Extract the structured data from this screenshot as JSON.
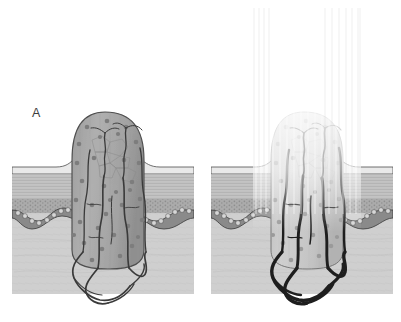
{
  "figure": {
    "type": "medical-illustration",
    "background_color": "#ffffff",
    "width": 401,
    "height": 322
  },
  "panels": [
    {
      "id": "a",
      "label": "A",
      "caption": "",
      "state": "untreated",
      "beam_present": false,
      "lesion": {
        "name": "lesion-mass",
        "fill": "#a9a9a9",
        "outline": "#4a4a4a",
        "nuclei_count": 34,
        "nuclei_color": "#7d7d7d",
        "dome_top_y": 112,
        "base_y": 268
      },
      "vessels": {
        "name": "blood-vessels",
        "color": "#3a3a3a",
        "stroke_width": 1.6,
        "state": "normal-caliber"
      }
    },
    {
      "id": "b",
      "label": "B",
      "caption": "",
      "state": "irradiated",
      "beam_present": true,
      "beam": {
        "name": "light-beam",
        "color": "#f2f2f2",
        "top_y": 10,
        "bottom_y": 230,
        "left_x": 50,
        "right_x": 158,
        "striation_count": 26
      },
      "lesion": {
        "name": "lesion-mass",
        "fill": "#c9c9c9",
        "outline": "#6e6e6e",
        "nuclei_count": 34,
        "nuclei_color": "#9a9a9a",
        "dome_top_y": 112,
        "base_y": 268,
        "bleached": true
      },
      "vessels": {
        "name": "blood-vessels",
        "color": "#1e1e1e",
        "stroke_width": 3.0,
        "state": "dilated-engorged"
      }
    }
  ],
  "skin_layers": [
    {
      "name": "stratum-corneum",
      "label": "stratum corneum",
      "top_y": 160,
      "bottom_y": 168,
      "color": "#e6e6e6"
    },
    {
      "name": "epidermis",
      "label": "epidermis",
      "top_y": 168,
      "bottom_y": 190,
      "color": "#c4c4c4"
    },
    {
      "name": "papillary-dermis",
      "label": "papillary dermis",
      "top_y": 190,
      "bottom_y": 206,
      "color": "#a8a8a8"
    },
    {
      "name": "basal-layer",
      "label": "basal cell layer",
      "top_y": 206,
      "bottom_y": 216,
      "color": "#7a7a7a"
    },
    {
      "name": "reticular-dermis",
      "label": "reticular dermis",
      "top_y": 216,
      "bottom_y": 292,
      "color": "#cfcfcf"
    }
  ],
  "colors": {
    "background": "#ffffff",
    "lesion_fill": "#a9a9a9",
    "lesion_fill_bleached": "#c9c9c9",
    "vessel_dark": "#1e1e1e",
    "vessel_normal": "#3a3a3a",
    "dermis": "#cfcfcf",
    "epidermis": "#c4c4c4",
    "basal": "#7a7a7a",
    "beam": "#f4f4f4",
    "label_text": "#3c3c3c"
  }
}
